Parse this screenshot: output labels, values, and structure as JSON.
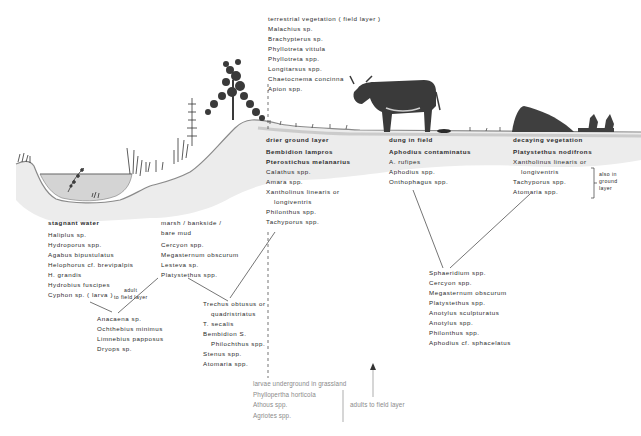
{
  "habitats": {
    "terrestrial": {
      "heading": "terrestrial vegetation ( field layer )",
      "species": [
        "Malachius sp.",
        "Brachypterus sp.",
        "Phyllotreta vittula",
        "Phyllotreta spp.",
        "Longitarsus spp.",
        "Chaetocnema concinna",
        "Apion spp."
      ]
    },
    "drier_ground": {
      "heading": "drier ground layer",
      "species": [
        "Bembidion lampros",
        "Pterostichus melanarius",
        "Calathus spp.",
        "Amara spp.",
        "Xantholinus linearis or",
        "longiventris",
        "Philonthus spp.",
        "Tachyporus spp."
      ]
    },
    "dung": {
      "heading": "dung in field",
      "species": [
        "Aphodius contaminatus",
        "A. rufipes",
        "Aphodius spp.",
        "Onthophagus spp."
      ]
    },
    "decaying": {
      "heading": "decaying vegetation",
      "species": [
        "Platystethus nodifrons",
        "Xantholinus linearis or",
        "longiventris",
        "Tachyporus spp.",
        "Atomaria spp."
      ],
      "bracket_note": [
        "also in",
        "ground",
        "layer"
      ]
    },
    "stagnant_water": {
      "heading": "stagnant water",
      "species": [
        "Haliplus sp.",
        "Hydroporus spp.",
        "Agabus bipustulatus",
        "Helophorus cf. brevipalpis",
        "H. grandis",
        "Hydrobius fuscipes",
        "Cyphon sp. ( larva )"
      ],
      "cyphon_note": [
        "adult",
        "to field layer"
      ]
    },
    "marsh": {
      "heading_lines": [
        "marsh / bankside /",
        "bare mud"
      ],
      "species": [
        "Cercyon spp.",
        "Megasternum obscurum",
        "Lesteva sp.",
        "Platystethus spp."
      ]
    },
    "shared_water_marsh": {
      "species": [
        "Anacaena sp.",
        "Ochthebius minimus",
        "Limnebius papposus",
        "Dryops sp."
      ]
    },
    "shared_marsh_drier": {
      "species": [
        "Trechus obtusus or",
        "quadristriatus",
        "T. secalis",
        "Bembidion S.",
        "Philochthus spp.",
        "Stenus spp.",
        "Atomaria spp."
      ]
    },
    "shared_dung_decaying": {
      "species": [
        "Sphaeridium spp.",
        "Cercyon spp.",
        "Megasternum obscurum",
        "Platystethus spp.",
        "Anotylus sculpturatus",
        "Anotylus spp.",
        "Philonthus spp.",
        "Aphodius cf. sphacelatus"
      ]
    },
    "underground": {
      "heading": "larvae underground in grassland",
      "species": [
        "Phyllopertha horticola",
        "Athous spp.",
        "Agriotes spp."
      ],
      "bracket_note": "adults to field layer"
    }
  },
  "colors": {
    "ground": "#e6e6e6",
    "ground_edge": "#9a9a9a",
    "water": "#cfcfcf",
    "ink": "#2a2a2a",
    "cow": "#3a3a3a"
  }
}
